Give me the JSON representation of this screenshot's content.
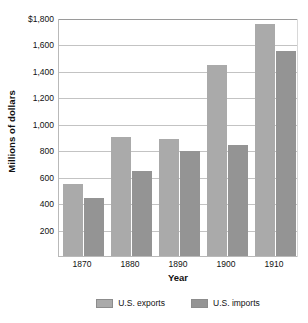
{
  "chart_data": {
    "type": "bar",
    "title": "",
    "subtitle": "",
    "xlabel": "Year",
    "ylabel": "Millions of dollars",
    "categories": [
      "1870",
      "1880",
      "1890",
      "1900",
      "1910"
    ],
    "series": [
      {
        "name": "U.S. exports",
        "color": "#aaaaaa",
        "values": [
          555,
          905,
          890,
          1455,
          1760
        ]
      },
      {
        "name": "U.S. imports",
        "color": "#949494",
        "values": [
          450,
          650,
          800,
          850,
          1555
        ]
      }
    ],
    "ylim": [
      0,
      1800
    ],
    "ytick_values": [
      1800,
      1600,
      1400,
      1200,
      1000,
      800,
      600,
      400,
      200
    ],
    "ytick_labels": [
      "$1,800",
      "1,600",
      "1,400",
      "1,200",
      "1,000",
      "800",
      "600",
      "400",
      "200"
    ],
    "grid": true,
    "legend_position": "bottom"
  },
  "axes": {
    "y_title": "Millions of dollars",
    "x_title": "Year"
  }
}
